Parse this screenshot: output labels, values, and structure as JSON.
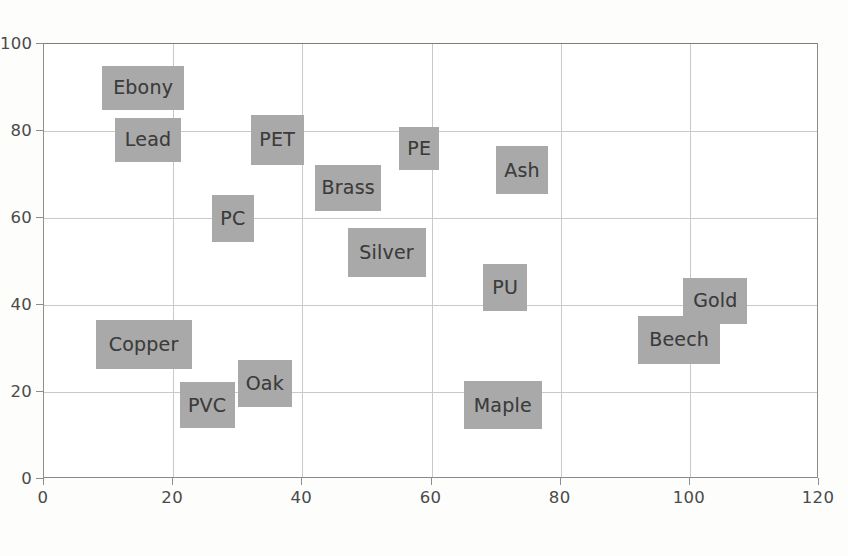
{
  "chart_data": {
    "type": "scatter",
    "title": "",
    "subtitle": "",
    "xlabel": "",
    "ylabel": "",
    "xlim": [
      0,
      120
    ],
    "ylim": [
      0,
      100
    ],
    "xticks": [
      0,
      20,
      40,
      60,
      80,
      100,
      120
    ],
    "yticks": [
      0,
      20,
      40,
      60,
      80,
      100
    ],
    "xtick_labels": [
      "0",
      "20",
      "40",
      "60",
      "80",
      "100",
      "120"
    ],
    "ytick_labels": [
      "0",
      "20",
      "40",
      "60",
      "80",
      "100"
    ],
    "grid": true,
    "legend": false,
    "legend_position": "none",
    "marker_style": "label-box",
    "box_fill_color": "#a9a9a9",
    "box_text_color": "#3c3c3c",
    "gridline_color": "#c9c9c9",
    "frame_color": "#8a8a8a",
    "points": [
      {
        "label": "Ebony",
        "x": 9,
        "y": 90,
        "box_w": 82,
        "box_h": 44
      },
      {
        "label": "Lead",
        "x": 11,
        "y": 78,
        "box_w": 66,
        "box_h": 44
      },
      {
        "label": "PET",
        "x": 32,
        "y": 78,
        "box_w": 53,
        "box_h": 50
      },
      {
        "label": "PE",
        "x": 55,
        "y": 76,
        "box_w": 40,
        "box_h": 43
      },
      {
        "label": "Ash",
        "x": 70,
        "y": 71,
        "box_w": 52,
        "box_h": 48
      },
      {
        "label": "Brass",
        "x": 42,
        "y": 67,
        "box_w": 66,
        "box_h": 46
      },
      {
        "label": "PC",
        "x": 26,
        "y": 60,
        "box_w": 42,
        "box_h": 47
      },
      {
        "label": "Silver",
        "x": 47,
        "y": 52,
        "box_w": 78,
        "box_h": 49
      },
      {
        "label": "PU",
        "x": 68,
        "y": 44,
        "box_w": 44,
        "box_h": 47
      },
      {
        "label": "Gold",
        "x": 99,
        "y": 41,
        "box_w": 64,
        "box_h": 46
      },
      {
        "label": "Beech",
        "x": 92,
        "y": 32,
        "box_w": 82,
        "box_h": 48
      },
      {
        "label": "Copper",
        "x": 8,
        "y": 31,
        "box_w": 96,
        "box_h": 49
      },
      {
        "label": "Oak",
        "x": 30,
        "y": 22,
        "box_w": 54,
        "box_h": 47
      },
      {
        "label": "PVC",
        "x": 21,
        "y": 17,
        "box_w": 55,
        "box_h": 46
      },
      {
        "label": "Maple",
        "x": 65,
        "y": 17,
        "box_w": 78,
        "box_h": 48
      }
    ]
  }
}
